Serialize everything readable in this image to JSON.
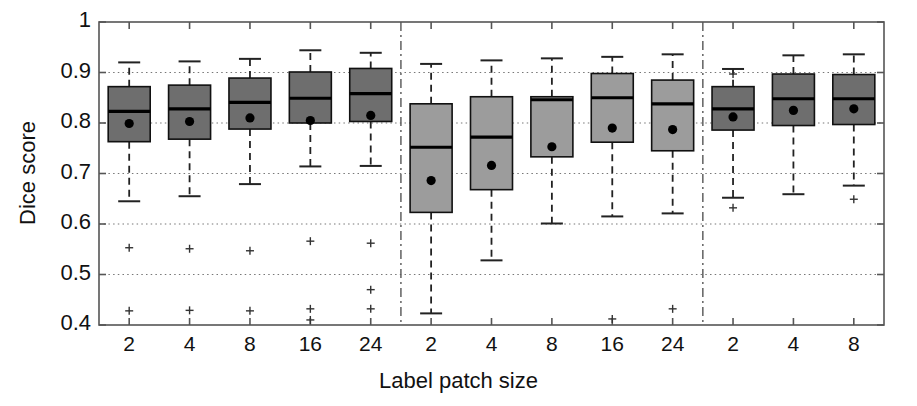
{
  "chart_data": {
    "type": "box",
    "title": "",
    "xlabel": "Label patch size",
    "ylabel": "Dice score",
    "ylim": [
      0.4,
      1.0
    ],
    "yticks": [
      0.4,
      0.5,
      0.6,
      0.7,
      0.8,
      0.9,
      1
    ],
    "ytick_labels": [
      "0.4",
      "0.5",
      "0.6",
      "0.7",
      "0.8",
      "0.9",
      "1"
    ],
    "grid": "horizontal-dotted",
    "legend": "none",
    "categories": [
      "2",
      "4",
      "8",
      "16",
      "24",
      "2",
      "4",
      "8",
      "16",
      "24",
      "2",
      "4",
      "8"
    ],
    "group_separators": [
      5,
      10
    ],
    "colors": {
      "box_dark": "#6e6e6e",
      "box_light": "#9c9c9c",
      "outline": "#111111",
      "median": "#000000",
      "mean_dot": "#000000",
      "whisker": "#222222",
      "grid": "#777777",
      "axis": "#555555",
      "separator": "#555555"
    },
    "boxes": [
      {
        "label": "2",
        "group": 1,
        "shade": "dark",
        "q1": 0.763,
        "median": 0.823,
        "q3": 0.872,
        "mean": 0.799,
        "whisker_low": 0.645,
        "whisker_high": 0.92,
        "outliers": [
          0.553,
          0.428
        ]
      },
      {
        "label": "4",
        "group": 1,
        "shade": "dark",
        "q1": 0.768,
        "median": 0.828,
        "q3": 0.875,
        "mean": 0.803,
        "whisker_low": 0.655,
        "whisker_high": 0.922,
        "outliers": [
          0.551,
          0.429
        ]
      },
      {
        "label": "8",
        "group": 1,
        "shade": "dark",
        "q1": 0.788,
        "median": 0.841,
        "q3": 0.889,
        "mean": 0.81,
        "whisker_low": 0.679,
        "whisker_high": 0.927,
        "outliers": [
          0.547,
          0.428
        ]
      },
      {
        "label": "16",
        "group": 1,
        "shade": "dark",
        "q1": 0.8,
        "median": 0.849,
        "q3": 0.901,
        "mean": 0.805,
        "whisker_low": 0.714,
        "whisker_high": 0.944,
        "outliers": [
          0.566,
          0.432,
          0.41
        ]
      },
      {
        "label": "24",
        "group": 1,
        "shade": "dark",
        "q1": 0.803,
        "median": 0.858,
        "q3": 0.908,
        "mean": 0.815,
        "whisker_low": 0.715,
        "whisker_high": 0.939,
        "outliers": [
          0.562,
          0.47,
          0.432
        ]
      },
      {
        "label": "2",
        "group": 2,
        "shade": "light",
        "q1": 0.623,
        "median": 0.752,
        "q3": 0.838,
        "mean": 0.686,
        "whisker_low": 0.423,
        "whisker_high": 0.917,
        "outliers": []
      },
      {
        "label": "4",
        "group": 2,
        "shade": "light",
        "q1": 0.668,
        "median": 0.772,
        "q3": 0.852,
        "mean": 0.716,
        "whisker_low": 0.528,
        "whisker_high": 0.924,
        "outliers": []
      },
      {
        "label": "8",
        "group": 2,
        "shade": "light",
        "q1": 0.733,
        "median": 0.846,
        "q3": 0.852,
        "mean": 0.753,
        "whisker_low": 0.601,
        "whisker_high": 0.928,
        "outliers": []
      },
      {
        "label": "16",
        "group": 2,
        "shade": "light",
        "q1": 0.762,
        "median": 0.85,
        "q3": 0.898,
        "mean": 0.79,
        "whisker_low": 0.615,
        "whisker_high": 0.931,
        "outliers": [
          0.412
        ]
      },
      {
        "label": "24",
        "group": 2,
        "shade": "light",
        "q1": 0.745,
        "median": 0.838,
        "q3": 0.885,
        "mean": 0.787,
        "whisker_low": 0.621,
        "whisker_high": 0.936,
        "outliers": [
          0.432
        ]
      },
      {
        "label": "2",
        "group": 3,
        "shade": "dark",
        "q1": 0.786,
        "median": 0.828,
        "q3": 0.872,
        "mean": 0.812,
        "whisker_low": 0.652,
        "whisker_high": 0.907,
        "outliers": [
          0.632,
          0.897
        ]
      },
      {
        "label": "4",
        "group": 3,
        "shade": "dark",
        "q1": 0.795,
        "median": 0.848,
        "q3": 0.897,
        "mean": 0.825,
        "whisker_low": 0.659,
        "whisker_high": 0.934,
        "outliers": []
      },
      {
        "label": "8",
        "group": 3,
        "shade": "dark",
        "q1": 0.797,
        "median": 0.848,
        "q3": 0.896,
        "mean": 0.828,
        "whisker_low": 0.676,
        "whisker_high": 0.936,
        "outliers": [
          0.649
        ]
      }
    ]
  }
}
